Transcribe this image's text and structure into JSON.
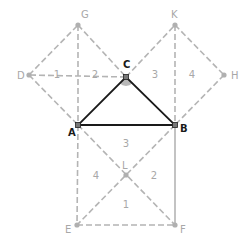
{
  "diagram": {
    "title": "",
    "colors": {
      "triangle": "#1a1a1a",
      "construction": "#b4b4b4",
      "angle_marker": "#b8b8b8",
      "labels_main": "#1a1a1a",
      "labels_secondary": "#a8a8a8"
    },
    "points": {
      "A": {
        "label": "A",
        "x": 78,
        "y": 125
      },
      "B": {
        "label": "B",
        "x": 175,
        "y": 125
      },
      "C": {
        "label": "C",
        "x": 126,
        "y": 77
      },
      "D": {
        "label": "D",
        "x": 29,
        "y": 75
      },
      "G": {
        "label": "G",
        "x": 78,
        "y": 25
      },
      "K": {
        "label": "K",
        "x": 175,
        "y": 25
      },
      "H": {
        "label": "H",
        "x": 224,
        "y": 75
      },
      "E": {
        "label": "E",
        "x": 77,
        "y": 225
      },
      "F": {
        "label": "F",
        "x": 175,
        "y": 225
      },
      "L": {
        "label": "L",
        "x": 126,
        "y": 175
      }
    },
    "triangle": [
      "A",
      "B",
      "C"
    ],
    "right_angle_at": "C",
    "region_labels": [
      {
        "text": "1",
        "x": 57,
        "y": 78
      },
      {
        "text": "2",
        "x": 95,
        "y": 78
      },
      {
        "text": "3",
        "x": 155,
        "y": 78
      },
      {
        "text": "4",
        "x": 192,
        "y": 78
      },
      {
        "text": "3",
        "x": 126,
        "y": 147
      },
      {
        "text": "4",
        "x": 96,
        "y": 179
      },
      {
        "text": "2",
        "x": 154,
        "y": 179
      },
      {
        "text": "1",
        "x": 126,
        "y": 208
      }
    ]
  }
}
